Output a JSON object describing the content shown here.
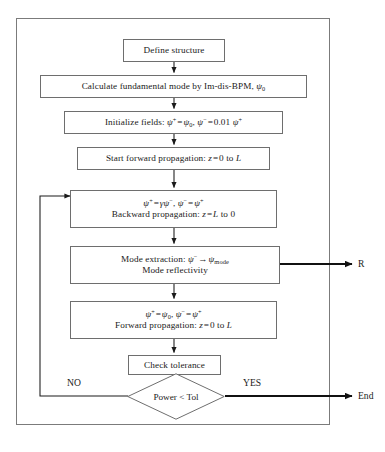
{
  "figure": {
    "type": "flowchart",
    "border_color": "#7b7b7b",
    "node_border_color": "#6e6e6e",
    "line_color": "#1a1a1a",
    "background": "#ffffff"
  },
  "nodes": {
    "define_structure": {
      "id": "define-structure",
      "shape": "process",
      "lines": [
        "Define structure"
      ]
    },
    "calculate_fundamental": {
      "id": "calculate-fundamental-mode",
      "shape": "process",
      "lines": [
        "Calculate fundamental mode by Im-dis-BPM, ψ₀"
      ]
    },
    "initialize_fields": {
      "id": "initialize-fields",
      "shape": "process",
      "lines": [
        "Initialize fields: ψ⁺ = ψ₀, ψ⁻ = 0.01 ψ⁺"
      ]
    },
    "start_forward": {
      "id": "start-forward-propagation",
      "shape": "process",
      "lines": [
        "Start forward propagation: z = 0 to L"
      ]
    },
    "backward": {
      "id": "backward-propagation",
      "shape": "process",
      "lines": [
        "ψ⁺ = γψ⁻, ψ⁻ = ψ⁺",
        "Backward propagation: z = L to 0"
      ]
    },
    "mode_extraction": {
      "id": "mode-extraction",
      "shape": "process",
      "lines": [
        "Mode extraction: ψ⁻ → ψmode",
        "Mode reflectivity"
      ]
    },
    "forward": {
      "id": "forward-propagation",
      "shape": "process",
      "lines": [
        "ψ⁺ = ψ₀, ψ⁻ = ψ⁺",
        "Forward propagation: z = 0 to L"
      ]
    },
    "check_tolerance": {
      "id": "check-tolerance",
      "shape": "process",
      "lines": [
        "Check tolerance"
      ]
    },
    "decision": {
      "id": "power-less-than-tol",
      "shape": "decision",
      "lines": [
        "Power < Tol"
      ]
    }
  },
  "labels": {
    "no": "NO",
    "yes": "YES",
    "reflectivity_output": "R",
    "end_output": "End"
  },
  "edges": [
    {
      "from": "define-structure",
      "to": "calculate-fundamental-mode",
      "label": ""
    },
    {
      "from": "calculate-fundamental-mode",
      "to": "initialize-fields",
      "label": ""
    },
    {
      "from": "initialize-fields",
      "to": "start-forward-propagation",
      "label": ""
    },
    {
      "from": "start-forward-propagation",
      "to": "backward-propagation",
      "label": ""
    },
    {
      "from": "backward-propagation",
      "to": "mode-extraction",
      "label": ""
    },
    {
      "from": "mode-extraction",
      "to": "reflectivity-output",
      "label": "R"
    },
    {
      "from": "mode-extraction",
      "to": "forward-propagation",
      "label": ""
    },
    {
      "from": "forward-propagation",
      "to": "check-tolerance",
      "label": ""
    },
    {
      "from": "check-tolerance",
      "to": "power-less-than-tol",
      "label": ""
    },
    {
      "from": "power-less-than-tol",
      "to": "backward-propagation",
      "label": "NO"
    },
    {
      "from": "power-less-than-tol",
      "to": "end-output",
      "label": "YES"
    }
  ],
  "caption": {
    "text": "",
    "visible": false
  }
}
